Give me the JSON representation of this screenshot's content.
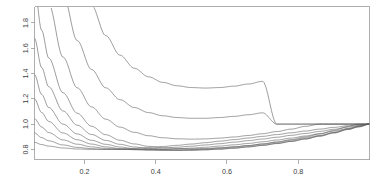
{
  "chart_data": {
    "type": "line",
    "title": "",
    "subtitle": "",
    "xlabel": "",
    "ylabel": "",
    "xlim": [
      0.06,
      1.0
    ],
    "ylim": [
      0.72,
      1.93
    ],
    "grid": false,
    "legend": false,
    "legend_position": "none",
    "x_ticks": [
      0.2,
      0.4,
      0.6,
      0.8
    ],
    "x_tick_labels": [
      "0.2",
      "0.4",
      "0.6",
      "0.8"
    ],
    "y_ticks": [
      0.8,
      1.0,
      1.2,
      1.4,
      1.6,
      1.8
    ],
    "y_tick_labels": [
      "0.8",
      "1.0",
      "1.2",
      "1.4",
      "1.6",
      "1.8"
    ],
    "series_count": 10,
    "convergence_point": [
      1.0,
      1.0
    ],
    "line_color": "#5a5a5a",
    "axis_color": "#9a9a9a",
    "background_color": "#ffffff",
    "series": [
      {
        "name": "k = 0.10",
        "k": 0.1,
        "x": [
          0.06,
          0.08,
          0.1,
          0.14,
          0.18,
          0.22,
          0.26,
          0.3,
          0.34,
          0.38,
          0.42,
          0.46,
          0.5,
          0.54,
          0.58,
          0.62,
          0.66,
          0.7,
          0.74,
          0.78,
          0.82,
          0.86,
          0.9,
          0.94,
          0.97,
          1.0
        ],
        "values": [
          0.856,
          0.838,
          0.826,
          0.811,
          0.803,
          0.8,
          0.8,
          0.803,
          0.808,
          0.815,
          0.823,
          0.832,
          0.842,
          0.853,
          0.865,
          0.877,
          0.89,
          0.903,
          0.917,
          0.931,
          0.945,
          0.96,
          0.974,
          0.987,
          0.995,
          1.0
        ]
      },
      {
        "name": "k = 0.20",
        "k": 0.2,
        "x": [
          0.06,
          0.08,
          0.1,
          0.14,
          0.18,
          0.22,
          0.26,
          0.3,
          0.34,
          0.38,
          0.42,
          0.46,
          0.5,
          0.54,
          0.58,
          0.62,
          0.66,
          0.7,
          0.74,
          0.78,
          0.82,
          0.86,
          0.9,
          0.94,
          0.97,
          1.0
        ],
        "values": [
          0.93,
          0.893,
          0.868,
          0.835,
          0.816,
          0.806,
          0.8,
          0.799,
          0.8,
          0.804,
          0.81,
          0.817,
          0.825,
          0.835,
          0.845,
          0.857,
          0.869,
          0.882,
          0.896,
          0.911,
          0.926,
          0.942,
          0.959,
          0.976,
          0.988,
          1.0
        ]
      },
      {
        "name": "k = 0.32",
        "k": 0.32,
        "x": [
          0.06,
          0.08,
          0.1,
          0.14,
          0.18,
          0.22,
          0.26,
          0.3,
          0.34,
          0.38,
          0.42,
          0.46,
          0.5,
          0.54,
          0.58,
          0.62,
          0.66,
          0.7,
          0.74,
          0.78,
          0.82,
          0.86,
          0.9,
          0.94,
          0.97,
          1.0
        ],
        "values": [
          1.043,
          0.977,
          0.933,
          0.875,
          0.841,
          0.82,
          0.808,
          0.801,
          0.798,
          0.798,
          0.8,
          0.804,
          0.81,
          0.817,
          0.826,
          0.836,
          0.847,
          0.86,
          0.874,
          0.889,
          0.906,
          0.924,
          0.944,
          0.965,
          0.981,
          1.0
        ]
      },
      {
        "name": "k = 0.46",
        "k": 0.46,
        "x": [
          0.06,
          0.08,
          0.1,
          0.14,
          0.18,
          0.22,
          0.26,
          0.3,
          0.34,
          0.38,
          0.42,
          0.46,
          0.5,
          0.54,
          0.58,
          0.62,
          0.66,
          0.7,
          0.74,
          0.78,
          0.82,
          0.86,
          0.9,
          0.94,
          0.97,
          1.0
        ],
        "values": [
          1.2,
          1.092,
          1.021,
          0.93,
          0.876,
          0.842,
          0.82,
          0.806,
          0.798,
          0.794,
          0.793,
          0.794,
          0.798,
          0.803,
          0.811,
          0.819,
          0.83,
          0.842,
          0.856,
          0.872,
          0.89,
          0.91,
          0.933,
          0.959,
          0.978,
          1.0
        ]
      },
      {
        "name": "k = 0.60",
        "k": 0.6,
        "x": [
          0.06,
          0.08,
          0.1,
          0.14,
          0.18,
          0.22,
          0.26,
          0.3,
          0.34,
          0.38,
          0.42,
          0.46,
          0.5,
          0.54,
          0.58,
          0.62,
          0.66,
          0.7,
          0.74,
          0.78,
          0.82,
          0.86,
          0.9,
          0.94,
          0.97,
          1.0
        ],
        "values": [
          1.392,
          1.235,
          1.131,
          1.0,
          0.922,
          0.872,
          0.84,
          0.819,
          0.805,
          0.797,
          0.793,
          0.792,
          0.793,
          0.797,
          0.803,
          0.811,
          0.821,
          0.833,
          0.847,
          0.863,
          0.882,
          0.904,
          0.929,
          0.957,
          0.979,
          1.0
        ]
      },
      {
        "name": "k = 0.76",
        "k": 0.76,
        "x": [
          0.06,
          0.08,
          0.1,
          0.14,
          0.18,
          0.22,
          0.26,
          0.3,
          0.34,
          0.38,
          0.42,
          0.46,
          0.5,
          0.54,
          0.58,
          0.62,
          0.66,
          0.7,
          0.74,
          0.78,
          0.82,
          0.86,
          0.9,
          0.94,
          0.97,
          1.0
        ],
        "values": [
          1.68,
          1.448,
          1.295,
          1.104,
          0.991,
          0.918,
          0.871,
          0.84,
          0.819,
          0.806,
          0.799,
          0.795,
          0.795,
          0.797,
          0.802,
          0.809,
          0.819,
          0.831,
          0.846,
          0.863,
          0.883,
          0.906,
          0.933,
          0.963,
          0.987,
          1.0
        ]
      },
      {
        "name": "k = 0.94",
        "k": 0.94,
        "x": [
          0.06,
          0.08,
          0.1,
          0.14,
          0.18,
          0.22,
          0.26,
          0.3,
          0.34,
          0.38,
          0.42,
          0.46,
          0.5,
          0.54,
          0.58,
          0.62,
          0.66,
          0.7,
          0.74,
          0.78,
          0.82,
          0.86,
          0.9,
          0.94,
          0.97,
          1.0
        ],
        "values": [
          2.08,
          1.742,
          1.522,
          1.248,
          1.086,
          0.983,
          0.916,
          0.872,
          0.843,
          0.824,
          0.813,
          0.807,
          0.805,
          0.807,
          0.812,
          0.82,
          0.83,
          0.843,
          0.859,
          0.877,
          0.898,
          0.922,
          0.95,
          0.981,
          1.0,
          1.0
        ]
      },
      {
        "name": "k = 1.20",
        "k": 1.2,
        "x": [
          0.06,
          0.08,
          0.1,
          0.14,
          0.18,
          0.22,
          0.26,
          0.3,
          0.34,
          0.38,
          0.42,
          0.46,
          0.5,
          0.54,
          0.58,
          0.62,
          0.66,
          0.7,
          0.74,
          0.78,
          0.82,
          0.86,
          0.9,
          0.94,
          0.97,
          1.0
        ],
        "values": [
          2.82,
          2.29,
          1.95,
          1.53,
          1.287,
          1.136,
          1.039,
          0.976,
          0.935,
          0.908,
          0.892,
          0.884,
          0.881,
          0.883,
          0.889,
          0.898,
          0.91,
          0.924,
          0.941,
          0.96,
          0.982,
          1.0,
          1.0,
          1.0,
          1.0,
          1.0
        ]
      },
      {
        "name": "k = 1.55",
        "k": 1.55,
        "x": [
          0.06,
          0.08,
          0.1,
          0.14,
          0.18,
          0.22,
          0.26,
          0.3,
          0.34,
          0.38,
          0.42,
          0.46,
          0.5,
          0.54,
          0.58,
          0.62,
          0.66,
          0.7,
          0.74,
          0.78,
          0.82,
          0.86,
          0.9,
          0.94,
          0.97,
          1.0
        ],
        "values": [
          4.12,
          3.24,
          2.69,
          2.03,
          1.66,
          1.432,
          1.287,
          1.193,
          1.131,
          1.091,
          1.066,
          1.052,
          1.046,
          1.046,
          1.052,
          1.061,
          1.074,
          1.089,
          1.0,
          1.0,
          1.0,
          1.0,
          1.0,
          1.0,
          1.0,
          1.0
        ]
      },
      {
        "name": "k = 2.05",
        "k": 2.05,
        "x": [
          0.06,
          0.08,
          0.1,
          0.14,
          0.18,
          0.22,
          0.26,
          0.3,
          0.34,
          0.38,
          0.42,
          0.46,
          0.5,
          0.54,
          0.58,
          0.62,
          0.66,
          0.7,
          0.74,
          0.78,
          0.82,
          0.86,
          0.9,
          0.94,
          0.97,
          1.0
        ],
        "values": [
          6.9,
          5.18,
          4.15,
          2.96,
          2.32,
          1.94,
          1.7,
          1.545,
          1.442,
          1.374,
          1.33,
          1.303,
          1.289,
          1.285,
          1.289,
          1.3,
          1.317,
          1.338,
          1.0,
          1.0,
          1.0,
          1.0,
          1.0,
          1.0,
          1.0,
          1.0
        ]
      }
    ]
  },
  "axes": {
    "x_axis_name": "x-axis",
    "y_axis_name": "y-axis"
  }
}
